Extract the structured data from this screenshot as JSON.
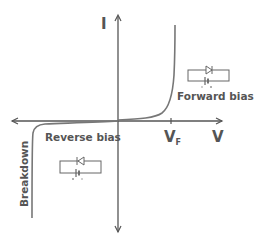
{
  "diagram": {
    "axes": {
      "y_label": "I",
      "x_label": "V",
      "vf_label_main": "V",
      "vf_label_sub": "F"
    },
    "regions": {
      "forward": "Forward bias",
      "reverse": "Reverse bias",
      "breakdown": "Breakdown"
    },
    "circuits": [
      {
        "name": "forward-bias-circuit",
        "diode_direction": "forward"
      },
      {
        "name": "reverse-bias-circuit",
        "diode_direction": "reverse"
      }
    ],
    "colors": {
      "axis": "#555555",
      "curve": "#777777",
      "text": "#555555",
      "circuit": "#666666"
    }
  }
}
